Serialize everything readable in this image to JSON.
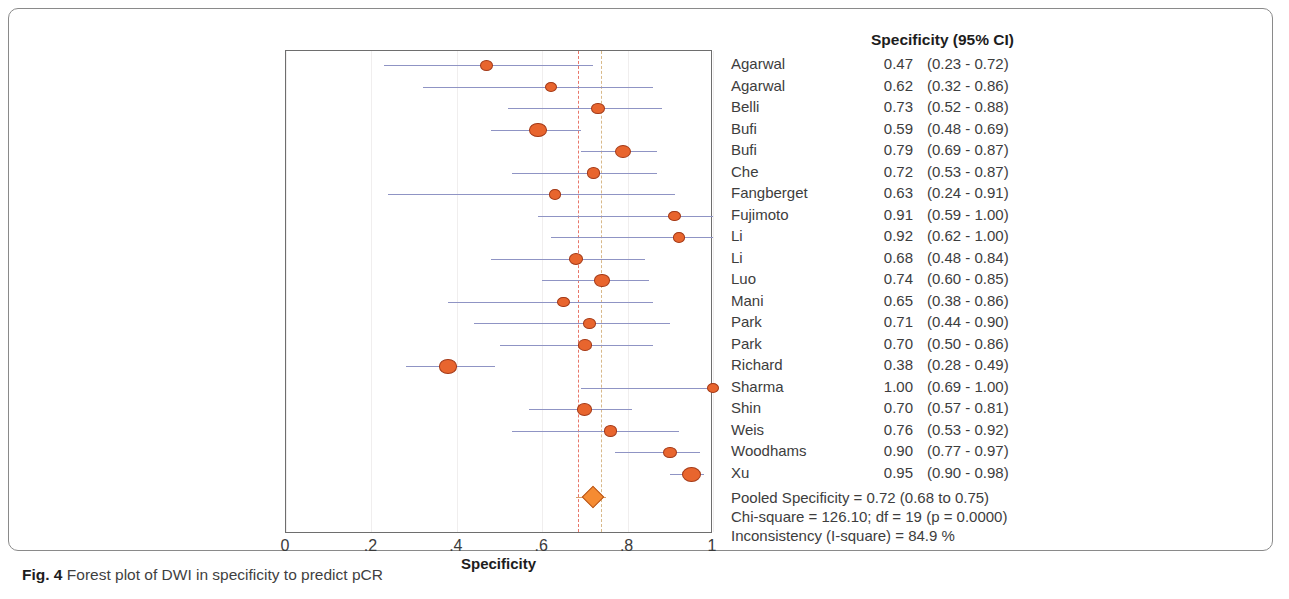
{
  "figure": {
    "caption_label": "Fig. 4",
    "caption_text": " Forest plot of DWI in specificity to predict pCR"
  },
  "table": {
    "header": "Specificity (95% CI)"
  },
  "axis": {
    "title": "Specificity",
    "ticks": [
      "0",
      ".2",
      ".4",
      ".6",
      ".8",
      "1"
    ]
  },
  "summary": {
    "pooled": "Pooled Specificity = 0.72 (0.68 to 0.75)",
    "chi_square": "Chi-square = 126.10; df =  19 (p = 0.0000)",
    "inconsistency": "Inconsistency (I-square) = 84.9 %"
  },
  "colors": {
    "marker_fill": "#e8652e",
    "marker_edge": "#a33a18",
    "ci_line": "#8f94c4",
    "pooled_refline": "#e8776a",
    "secondary_refline": "#d8b98a",
    "diamond_fill": "#f58b32"
  },
  "chart_data": {
    "type": "forest",
    "title": "Forest plot of DWI in specificity to predict pCR",
    "xlabel": "Specificity",
    "ylabel": "",
    "xlim": [
      0,
      1
    ],
    "xticks": [
      0,
      0.2,
      0.4,
      0.6,
      0.8,
      1.0
    ],
    "xticklabels": [
      "0",
      ".2",
      ".4",
      ".6",
      ".8",
      "1"
    ],
    "grid": true,
    "legend": "none",
    "reference_lines": [
      {
        "name": "pooled-specificity",
        "value": 0.683,
        "color": "#e8776a",
        "style": "dashed"
      },
      {
        "name": "secondary-reference",
        "value": 0.738,
        "color": "#d8b98a",
        "style": "dashed"
      }
    ],
    "studies": [
      {
        "name": "Agarwal",
        "estimate": 0.47,
        "ci_low": 0.23,
        "ci_high": 0.72,
        "estimate_label": "0.47",
        "ci_label": "(0.23 - 0.72)",
        "weight": 0.42
      },
      {
        "name": "Agarwal",
        "estimate": 0.62,
        "ci_low": 0.32,
        "ci_high": 0.86,
        "estimate_label": "0.62",
        "ci_label": "(0.32 - 0.86)",
        "weight": 0.34
      },
      {
        "name": "Belli",
        "estimate": 0.73,
        "ci_low": 0.52,
        "ci_high": 0.88,
        "estimate_label": "0.73",
        "ci_label": "(0.52 - 0.88)",
        "weight": 0.46
      },
      {
        "name": "Bufi",
        "estimate": 0.59,
        "ci_low": 0.48,
        "ci_high": 0.69,
        "estimate_label": "0.59",
        "ci_label": "(0.48 - 0.69)",
        "weight": 0.82
      },
      {
        "name": "Bufi",
        "estimate": 0.79,
        "ci_low": 0.69,
        "ci_high": 0.87,
        "estimate_label": "0.79",
        "ci_label": "(0.69 - 0.87)",
        "weight": 0.72
      },
      {
        "name": "Che",
        "estimate": 0.72,
        "ci_low": 0.53,
        "ci_high": 0.87,
        "estimate_label": "0.72",
        "ci_label": "(0.53 - 0.87)",
        "weight": 0.46
      },
      {
        "name": "Fangberget",
        "estimate": 0.63,
        "ci_low": 0.24,
        "ci_high": 0.91,
        "estimate_label": "0.63",
        "ci_label": "(0.24 - 0.91)",
        "weight": 0.3
      },
      {
        "name": "Fujimoto",
        "estimate": 0.91,
        "ci_low": 0.59,
        "ci_high": 1.0,
        "estimate_label": "0.91",
        "ci_label": "(0.59 - 1.00)",
        "weight": 0.34
      },
      {
        "name": "Li",
        "estimate": 0.92,
        "ci_low": 0.62,
        "ci_high": 1.0,
        "estimate_label": "0.92",
        "ci_label": "(0.62 - 1.00)",
        "weight": 0.34
      },
      {
        "name": "Li",
        "estimate": 0.68,
        "ci_low": 0.48,
        "ci_high": 0.84,
        "estimate_label": "0.68",
        "ci_label": "(0.48 - 0.84)",
        "weight": 0.5
      },
      {
        "name": "Luo",
        "estimate": 0.74,
        "ci_low": 0.6,
        "ci_high": 0.85,
        "estimate_label": "0.74",
        "ci_label": "(0.60 - 0.85)",
        "weight": 0.62
      },
      {
        "name": "Mani",
        "estimate": 0.65,
        "ci_low": 0.38,
        "ci_high": 0.86,
        "estimate_label": "0.65",
        "ci_label": "(0.38 - 0.86)",
        "weight": 0.38
      },
      {
        "name": "Park",
        "estimate": 0.71,
        "ci_low": 0.44,
        "ci_high": 0.9,
        "estimate_label": "0.71",
        "ci_label": "(0.44 - 0.90)",
        "weight": 0.38
      },
      {
        "name": "Park",
        "estimate": 0.7,
        "ci_low": 0.5,
        "ci_high": 0.86,
        "estimate_label": "0.70",
        "ci_label": "(0.50 - 0.86)",
        "weight": 0.46
      },
      {
        "name": "Richard",
        "estimate": 0.38,
        "ci_low": 0.28,
        "ci_high": 0.49,
        "estimate_label": "0.38",
        "ci_label": "(0.28 - 0.49)",
        "weight": 0.88
      },
      {
        "name": "Sharma",
        "estimate": 1.0,
        "ci_low": 0.69,
        "ci_high": 1.0,
        "estimate_label": "1.00",
        "ci_label": "(0.69 - 1.00)",
        "weight": 0.32
      },
      {
        "name": "Shin",
        "estimate": 0.7,
        "ci_low": 0.57,
        "ci_high": 0.81,
        "estimate_label": "0.70",
        "ci_label": "(0.57 - 0.81)",
        "weight": 0.62
      },
      {
        "name": "Weis",
        "estimate": 0.76,
        "ci_low": 0.53,
        "ci_high": 0.92,
        "estimate_label": "0.76",
        "ci_label": "(0.53 - 0.92)",
        "weight": 0.44
      },
      {
        "name": "Woodhams",
        "estimate": 0.9,
        "ci_low": 0.77,
        "ci_high": 0.97,
        "estimate_label": "0.90",
        "ci_label": "(0.77 - 0.97)",
        "weight": 0.52
      },
      {
        "name": "Xu",
        "estimate": 0.95,
        "ci_low": 0.9,
        "ci_high": 0.98,
        "estimate_label": "0.95",
        "ci_label": "(0.90 - 0.98)",
        "weight": 1.0
      }
    ],
    "pooled": {
      "label": "Pooled Specificity",
      "estimate": 0.72,
      "ci_low": 0.68,
      "ci_high": 0.75,
      "chi_square": 126.1,
      "df": 19,
      "p_value": "0.0000",
      "i_square": 84.9
    }
  }
}
